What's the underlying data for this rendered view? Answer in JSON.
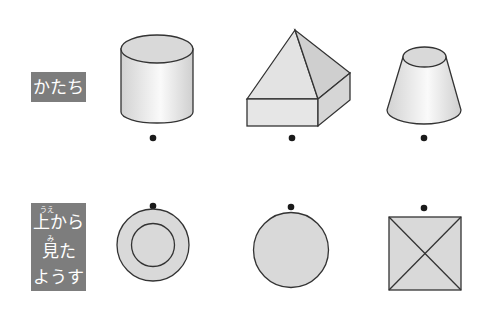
{
  "labels": {
    "shape": "かたち",
    "top_view": {
      "line1": "上から",
      "line1_ruby": "うえ",
      "line2": "見た",
      "line2_ruby": "み",
      "line3": "ようす"
    }
  },
  "shapes": [
    {
      "name": "cylinder",
      "top_view": "concentric-circles"
    },
    {
      "name": "square-pyramid-on-prism",
      "top_view": "circle"
    },
    {
      "name": "truncated-cone",
      "top_view": "square-with-diagonals"
    }
  ],
  "colors": {
    "label_bg": "#7d7d7d",
    "shape_fill": "#d9d9d9",
    "stroke": "#333333"
  }
}
